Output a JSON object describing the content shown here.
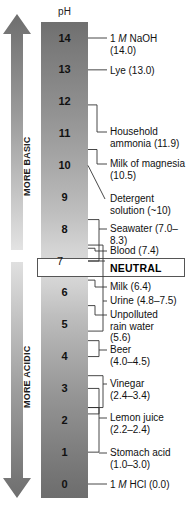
{
  "diagram": {
    "axis_header": "pH",
    "neutral_label": "NEUTRAL",
    "direction_labels": {
      "basic": "MORE BASIC",
      "acidic": "MORE ACIDIC"
    },
    "scale_numbers": [
      "14",
      "13",
      "12",
      "11",
      "10",
      "9",
      "8",
      "7",
      "6",
      "5",
      "4",
      "3",
      "2",
      "1",
      "0"
    ],
    "colors": {
      "bar_top": "#6f6f6f",
      "bar_middle": "#dcdcdc",
      "bar_bottom": "#6d6d6d",
      "line": "#333333",
      "text": "#111111"
    }
  },
  "chart_data": {
    "type": "bar",
    "ylabel": "pH",
    "ylim": [
      0,
      14
    ],
    "grid": false,
    "legend": null,
    "categories": [
      "1 M NaOH",
      "Lye",
      "Household ammonia",
      "Milk of magnesia",
      "Detergent solution",
      "Seawater",
      "Blood",
      "NEUTRAL",
      "Milk",
      "Urine",
      "Unpolluted rain water",
      "Beer",
      "Vinegar",
      "Lemon juice",
      "Stomach acid",
      "1 M HCl"
    ],
    "values": [
      14.0,
      13.0,
      11.9,
      10.5,
      10.0,
      7.65,
      7.4,
      7.0,
      6.4,
      6.15,
      5.6,
      4.25,
      2.9,
      2.3,
      2.0,
      0.0
    ]
  },
  "callouts": [
    {
      "id": "naoh",
      "name": "1 M NaOH",
      "value_text": "(14.0)",
      "ph_low": 14.0,
      "ph_high": 14.0,
      "line1": "1 M NaOH",
      "line2": "(14.0)"
    },
    {
      "id": "lye",
      "name": "Lye",
      "value_text": "(13.0)",
      "ph_low": 13.0,
      "ph_high": 13.0,
      "line1": "Lye (13.0)",
      "line2": ""
    },
    {
      "id": "ammonia",
      "name": "Household ammonia",
      "value_text": "(11.9)",
      "ph_low": 11.9,
      "ph_high": 11.9,
      "line1": "Household",
      "line2": "ammonia (11.9)"
    },
    {
      "id": "magnesia",
      "name": "Milk of magnesia",
      "value_text": "(10.5)",
      "ph_low": 10.5,
      "ph_high": 10.5,
      "line1": "Milk of magnesia",
      "line2": "(10.5)"
    },
    {
      "id": "detergent",
      "name": "Detergent solution",
      "value_text": "(~10)",
      "ph_low": 10.0,
      "ph_high": 10.0,
      "line1": "Detergent",
      "line2": "solution (~10)"
    },
    {
      "id": "seawater",
      "name": "Seawater",
      "value_text": "(7.0–8.3)",
      "ph_low": 7.0,
      "ph_high": 8.3,
      "line1": "Seawater (7.0–8.3)",
      "line2": ""
    },
    {
      "id": "blood",
      "name": "Blood",
      "value_text": "(7.4)",
      "ph_low": 7.4,
      "ph_high": 7.4,
      "line1": "Blood (7.4)",
      "line2": ""
    },
    {
      "id": "milk",
      "name": "Milk",
      "value_text": "(6.4)",
      "ph_low": 6.4,
      "ph_high": 6.4,
      "line1": "Milk (6.4)",
      "line2": ""
    },
    {
      "id": "urine",
      "name": "Urine",
      "value_text": "(4.8–7.5)",
      "ph_low": 4.8,
      "ph_high": 7.5,
      "line1": "Urine (4.8–7.5)",
      "line2": ""
    },
    {
      "id": "rainwater",
      "name": "Unpolluted rain water",
      "value_text": "(5.6)",
      "ph_low": 5.6,
      "ph_high": 5.6,
      "line1": "Unpolluted",
      "line2": "rain water\n(5.6)"
    },
    {
      "id": "beer",
      "name": "Beer",
      "value_text": "(4.0–4.5)",
      "ph_low": 4.0,
      "ph_high": 4.5,
      "line1": "Beer",
      "line2": "(4.0–4.5)"
    },
    {
      "id": "vinegar",
      "name": "Vinegar",
      "value_text": "(2.4–3.4)",
      "ph_low": 2.4,
      "ph_high": 3.4,
      "line1": "Vinegar",
      "line2": "(2.4–3.4)"
    },
    {
      "id": "lemon",
      "name": "Lemon juice",
      "value_text": "(2.2–2.4)",
      "ph_low": 2.2,
      "ph_high": 2.4,
      "line1": "Lemon juice",
      "line2": "(2.2–2.4)"
    },
    {
      "id": "stomach",
      "name": "Stomach acid",
      "value_text": "(1.0–3.0)",
      "ph_low": 1.0,
      "ph_high": 3.0,
      "line1": "Stomach acid",
      "line2": "(1.0–3.0)"
    },
    {
      "id": "hcl",
      "name": "1 M HCl",
      "value_text": "(0.0)",
      "ph_low": 0.0,
      "ph_high": 0.0,
      "line1": "1 M HCl (0.0)",
      "line2": ""
    }
  ]
}
